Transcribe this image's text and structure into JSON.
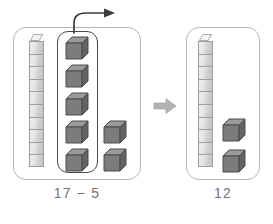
{
  "figure": {
    "kind": "base-ten-blocks-subtraction",
    "background_color": "#ffffff",
    "panel_border_color": "#b5b5b5",
    "selection_border_color": "#4a4a4a",
    "caption_color": "#737373"
  },
  "left_group": {
    "caption": "17 − 5",
    "rod": {
      "name": "ten-rod",
      "units": 10,
      "value": 10,
      "face_color": "#e3e3e3",
      "edge_color": "#9e9e9e"
    },
    "selection": {
      "label": "subtracted-group",
      "cube_count": 5
    },
    "loose_cubes": {
      "count": 2
    },
    "total": 17
  },
  "right_group": {
    "caption": "12",
    "rod": {
      "name": "ten-rod",
      "units": 10,
      "value": 10,
      "face_color": "#e3e3e3",
      "edge_color": "#9e9e9e"
    },
    "loose_cubes": {
      "count": 2
    },
    "total": 12
  },
  "cube_style": {
    "top_color": "#9a9a9a",
    "front_color": "#7c7c7c",
    "side_color": "#636363",
    "outline_color": "#4d4d4d"
  },
  "arrows": {
    "curved": {
      "icon": "curved-arrow-right-icon",
      "color": "#3d3d3d",
      "meaning": "remove"
    },
    "block": {
      "icon": "block-arrow-right-icon",
      "color": "#b0b0b0",
      "meaning": "equals"
    }
  },
  "chart_data": {
    "type": "table",
    "title": "17 − 5 = 12",
    "categories": [
      "17 − 5",
      "12"
    ],
    "values": [
      17,
      12
    ],
    "series": [
      {
        "name": "tens (rods)",
        "values": [
          1,
          1
        ]
      },
      {
        "name": "ones (cubes)",
        "values": [
          7,
          2
        ]
      },
      {
        "name": "removed ones",
        "values": [
          5,
          0
        ]
      }
    ],
    "xlabel": "",
    "ylabel": ""
  }
}
